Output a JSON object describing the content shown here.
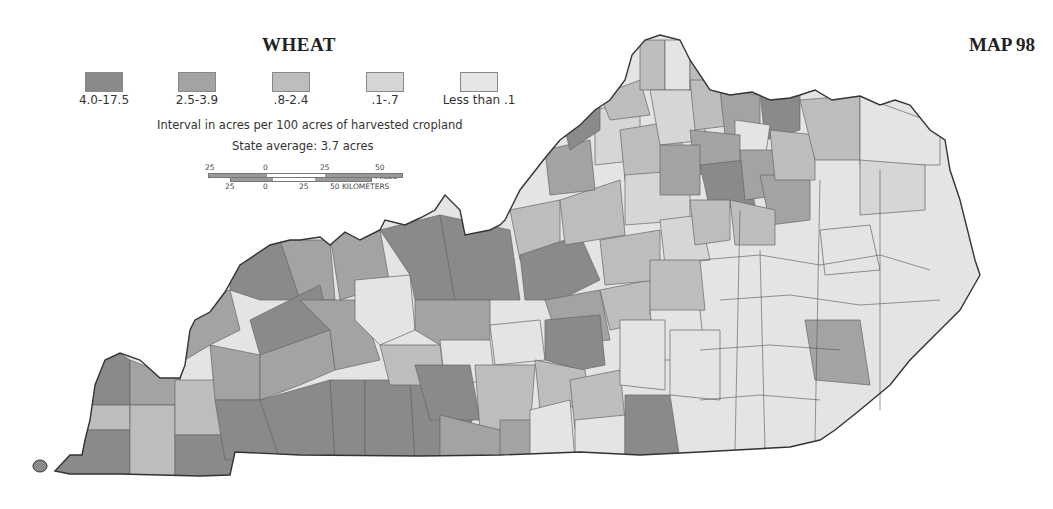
{
  "map": {
    "title": "WHEAT",
    "map_number": "MAP 98",
    "region": "Kentucky counties",
    "legend": {
      "items": [
        {
          "label": "4.0-17.5",
          "color": "#8a8a8a"
        },
        {
          "label": "2.5-3.9",
          "color": "#a3a3a3"
        },
        {
          "label": ".8-2.4",
          "color": "#bdbdbd"
        },
        {
          "label": ".1-.7",
          "color": "#d6d6d6"
        },
        {
          "label": "Less than .1",
          "color": "#e6e6e6"
        }
      ]
    },
    "interval_note": "Interval in acres per 100 acres of harvested cropland",
    "state_average": "State average: 3.7 acres",
    "scale": {
      "miles_ticks": [
        "25",
        "0",
        "25",
        "50 MILES"
      ],
      "km_ticks": [
        "25",
        "0",
        "25",
        "50 KILOMETERS"
      ]
    }
  }
}
